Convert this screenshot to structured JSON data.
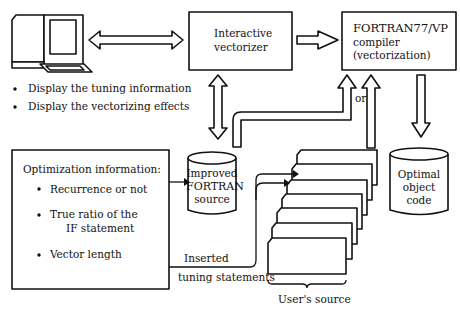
{
  "terminal": {
    "bullets": [
      "Display the tuning information",
      "Display the vectorizing effects"
    ]
  },
  "vectorizer": {
    "line1": "Interactive",
    "line2": "vectorizer"
  },
  "compiler": {
    "line1": "FORTRAN77/VP",
    "line2": "compiler",
    "line3": "(vectorization)"
  },
  "improved_source": {
    "line1": "Improved",
    "line2": "FORTRAN",
    "line3": "source"
  },
  "object_code": {
    "line1": "Optimal",
    "line2": "object",
    "line3": "code"
  },
  "optimization_info": {
    "title": "Optimization information:",
    "items": [
      "Recurrence or not",
      "True ratio of the",
      "IF statement",
      "Vector length"
    ]
  },
  "labels": {
    "or": "or",
    "inserted": "Inserted",
    "tuning_statements": "tuning statements",
    "users_source": "User's source"
  }
}
